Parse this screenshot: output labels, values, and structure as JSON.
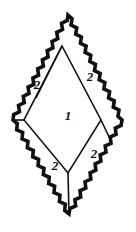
{
  "figure": {
    "type": "geometric-diagram",
    "colors": {
      "stroke": "#111111",
      "background": "#ffffff",
      "label": "#111111"
    },
    "outer_diamond": {
      "name": "outer-diamond",
      "stroke_style": "zigzag",
      "stroke_width": 4,
      "vertices": {
        "top": [
          68,
          15
        ],
        "right": [
          122,
          120
        ],
        "bottom": [
          69,
          214
        ],
        "left": [
          13,
          120
        ]
      }
    },
    "inner_diamond": {
      "name": "inner-diamond",
      "stroke_style": "straight",
      "stroke_width": 1.6,
      "vertices": {
        "top": [
          62,
          46
        ],
        "right": [
          101,
          120
        ],
        "bottom": [
          68,
          173
        ],
        "left": [
          24,
          120
        ]
      }
    },
    "connector_segments": [
      {
        "name": "top-left-connector",
        "from": [
          62,
          46
        ],
        "to": [
          36,
          98
        ]
      },
      {
        "name": "bottom-right-connector",
        "from": [
          101,
          120
        ],
        "to": [
          110,
          139
        ]
      },
      {
        "name": "bottom-left-connector",
        "from": [
          24,
          120
        ],
        "to": [
          13,
          120
        ]
      },
      {
        "name": "bottom-apex-connector",
        "from": [
          68,
          173
        ],
        "to": [
          69,
          214
        ]
      }
    ],
    "labels": [
      {
        "name": "region-label-upper-left",
        "text": "2",
        "x": 37,
        "y": 86
      },
      {
        "name": "region-label-upper-right",
        "text": "2",
        "x": 90,
        "y": 78
      },
      {
        "name": "region-label-center",
        "text": "1",
        "x": 68,
        "y": 117
      },
      {
        "name": "region-label-lower-left",
        "text": "2",
        "x": 55,
        "y": 167
      },
      {
        "name": "region-label-lower-right",
        "text": "2",
        "x": 94,
        "y": 155
      }
    ]
  }
}
